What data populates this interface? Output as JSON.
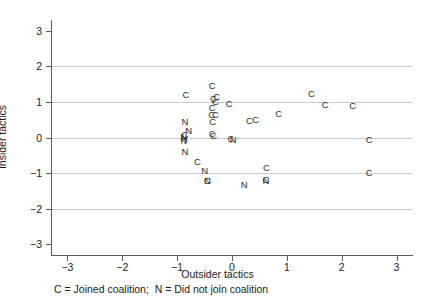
{
  "chart_data": {
    "type": "scatter",
    "title": "",
    "xlabel": "Outsider tactics",
    "ylabel": "Insider tactics",
    "xlim": [
      -3.3,
      3.3
    ],
    "ylim": [
      -3.3,
      3.3
    ],
    "xticks": [
      -3,
      -2,
      -1,
      0,
      1,
      2,
      3
    ],
    "yticks": [
      -3,
      -2,
      -1,
      0,
      1,
      2,
      3
    ],
    "xtick_labels": [
      "−3",
      "−2",
      "−1",
      "0",
      "1",
      "2",
      "3"
    ],
    "ytick_labels": [
      "−3",
      "−2",
      "−1",
      "0",
      "1",
      "2",
      "3"
    ],
    "gridlines": {
      "horizontal_at": [
        2,
        1,
        0,
        -1,
        -2
      ],
      "vertical": false
    },
    "legend_position": "below-axis",
    "caption": "C = Joined coalition;  N = Did not join coalition",
    "marker_style": "text-label",
    "series": [
      {
        "name": "Joined coalition",
        "label": "C",
        "points": [
          {
            "x": -0.84,
            "y": 1.18
          },
          {
            "x": -0.36,
            "y": 1.45
          },
          {
            "x": -0.34,
            "y": 1.08
          },
          {
            "x": -0.28,
            "y": 1.14
          },
          {
            "x": -0.3,
            "y": 1.0
          },
          {
            "x": -0.36,
            "y": 0.83
          },
          {
            "x": -0.37,
            "y": 0.64
          },
          {
            "x": -0.3,
            "y": 0.63
          },
          {
            "x": -0.35,
            "y": 0.44
          },
          {
            "x": -0.36,
            "y": 0.1
          },
          {
            "x": -0.34,
            "y": 0.04
          },
          {
            "x": -0.05,
            "y": 0.95
          },
          {
            "x": -0.02,
            "y": -0.04
          },
          {
            "x": 0.32,
            "y": 0.46
          },
          {
            "x": 0.43,
            "y": 0.5
          },
          {
            "x": 0.62,
            "y": -1.2
          },
          {
            "x": 0.63,
            "y": -0.86
          },
          {
            "x": 0.85,
            "y": 0.66
          },
          {
            "x": 1.45,
            "y": 1.22
          },
          {
            "x": 1.7,
            "y": 0.9
          },
          {
            "x": 2.2,
            "y": 0.88
          },
          {
            "x": 2.5,
            "y": -0.08
          },
          {
            "x": 2.5,
            "y": -1.0
          },
          {
            "x": -0.63,
            "y": -0.7
          },
          {
            "x": -0.45,
            "y": -1.22
          },
          {
            "x": -0.86,
            "y": 0.06
          }
        ]
      },
      {
        "name": "Did not join coalition",
        "label": "N",
        "points": [
          {
            "x": -0.86,
            "y": 0.43
          },
          {
            "x": -0.79,
            "y": 0.18
          },
          {
            "x": -0.88,
            "y": 0.02
          },
          {
            "x": -0.87,
            "y": -0.05
          },
          {
            "x": -0.88,
            "y": -0.1
          },
          {
            "x": -0.86,
            "y": -0.42
          },
          {
            "x": -0.5,
            "y": -0.93
          },
          {
            "x": -0.45,
            "y": -1.22
          },
          {
            "x": 0.02,
            "y": -0.07
          },
          {
            "x": 0.22,
            "y": -1.33
          },
          {
            "x": 0.62,
            "y": -1.21
          }
        ]
      }
    ]
  },
  "axis_titles": {
    "x": "Outsider tactics",
    "y": "Insider tactics"
  },
  "caption": "C = Joined coalition;  N = Did not join coalition"
}
